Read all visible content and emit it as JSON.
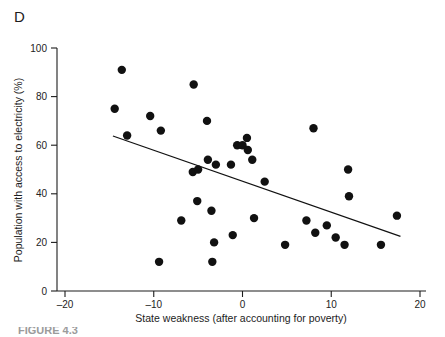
{
  "panel": {
    "label": "D"
  },
  "caption": {
    "partial_text": "FIGURE 4.3"
  },
  "chart_data": {
    "type": "scatter",
    "title": "",
    "xlabel": "State weakness (after accounting for poverty)",
    "ylabel": "Population with access to electricity (%)",
    "xlim": [
      -20,
      20
    ],
    "ylim": [
      0,
      100
    ],
    "xticks": [
      -20,
      -10,
      0,
      10,
      20
    ],
    "yticks": [
      0,
      20,
      40,
      60,
      80,
      100
    ],
    "xtick_labels": [
      "–20",
      "–10",
      "0",
      "10",
      "20"
    ],
    "ytick_labels": [
      "0",
      "20",
      "40",
      "60",
      "80",
      "100"
    ],
    "grid": false,
    "legend": null,
    "marker_color": "#111111",
    "marker_size": 4.2,
    "line_color": "#111111",
    "points": [
      {
        "x": -13.6,
        "y": 91
      },
      {
        "x": -14.4,
        "y": 75
      },
      {
        "x": -13.0,
        "y": 64
      },
      {
        "x": -10.4,
        "y": 72
      },
      {
        "x": -9.2,
        "y": 66
      },
      {
        "x": -9.4,
        "y": 12
      },
      {
        "x": -6.9,
        "y": 29
      },
      {
        "x": -5.5,
        "y": 85
      },
      {
        "x": -5.6,
        "y": 49
      },
      {
        "x": -5.0,
        "y": 50
      },
      {
        "x": -5.1,
        "y": 37
      },
      {
        "x": -4.0,
        "y": 70
      },
      {
        "x": -3.9,
        "y": 54
      },
      {
        "x": -3.5,
        "y": 33
      },
      {
        "x": -3.4,
        "y": 12
      },
      {
        "x": -3.2,
        "y": 20
      },
      {
        "x": -3.0,
        "y": 52
      },
      {
        "x": -1.3,
        "y": 52
      },
      {
        "x": -1.1,
        "y": 23
      },
      {
        "x": -0.6,
        "y": 60
      },
      {
        "x": 0.0,
        "y": 60
      },
      {
        "x": 0.5,
        "y": 63
      },
      {
        "x": 0.6,
        "y": 58
      },
      {
        "x": 1.1,
        "y": 54
      },
      {
        "x": 1.3,
        "y": 30
      },
      {
        "x": 2.5,
        "y": 45
      },
      {
        "x": 4.8,
        "y": 19
      },
      {
        "x": 7.2,
        "y": 29
      },
      {
        "x": 8.0,
        "y": 67
      },
      {
        "x": 8.2,
        "y": 24
      },
      {
        "x": 9.5,
        "y": 27
      },
      {
        "x": 10.5,
        "y": 22
      },
      {
        "x": 11.5,
        "y": 19
      },
      {
        "x": 11.9,
        "y": 50
      },
      {
        "x": 12.0,
        "y": 39
      },
      {
        "x": 15.6,
        "y": 19
      },
      {
        "x": 17.4,
        "y": 31
      }
    ],
    "trend_line": {
      "x1": -14.6,
      "y1": 63.8,
      "x2": 17.8,
      "y2": 22.5
    }
  }
}
